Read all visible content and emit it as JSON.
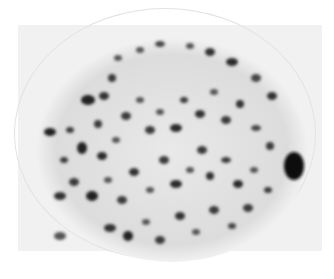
{
  "image": {
    "description": "Grayscale micrograph of a cell nucleus with dark speckled chromatin granules on a light background",
    "colors": {
      "background": "#ffffff",
      "field": "#f1f1f1",
      "dark_granule": "#1e1e1e",
      "mid_granule": "#555555"
    }
  }
}
